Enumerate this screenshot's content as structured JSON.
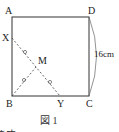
{
  "diagram": {
    "type": "geometry",
    "caption": "図 1",
    "side_label": "16cm",
    "points": {
      "A": {
        "label": "A",
        "x": 12,
        "y": 17
      },
      "D": {
        "label": "D",
        "x": 89,
        "y": 17
      },
      "B": {
        "label": "B",
        "x": 12,
        "y": 96
      },
      "C": {
        "label": "C",
        "x": 89,
        "y": 96
      },
      "X": {
        "label": "X",
        "x": 12,
        "y": 38
      },
      "Y": {
        "label": "Y",
        "x": 60,
        "y": 96
      },
      "M": {
        "label": "M",
        "x": 36,
        "y": 67
      }
    },
    "segments": [
      {
        "from": "A",
        "to": "D",
        "style": "solid"
      },
      {
        "from": "D",
        "to": "C",
        "style": "solid"
      },
      {
        "from": "C",
        "to": "B",
        "style": "solid"
      },
      {
        "from": "B",
        "to": "A",
        "style": "solid"
      },
      {
        "from": "X",
        "to": "Y",
        "style": "dashed"
      },
      {
        "from": "B",
        "to": "M",
        "style": "dashed"
      }
    ],
    "equal_marks": [
      "XM",
      "MY",
      "BM"
    ],
    "dimension_arc": {
      "from": "D",
      "to": "C",
      "label": "16cm"
    },
    "footer_partial_text": "ます。"
  }
}
